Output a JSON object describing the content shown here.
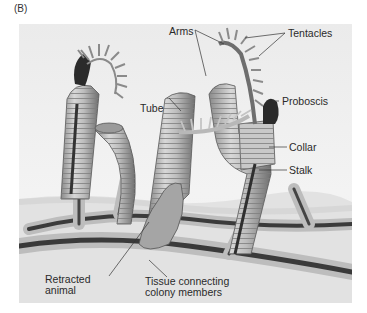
{
  "figure": {
    "panel_label": "(B)",
    "labels": {
      "arms": "Arms",
      "tentacles": "Tentacles",
      "proboscis": "Proboscis",
      "tube": "Tube",
      "collar": "Collar",
      "stalk": "Stalk",
      "retracted_line1": "Retracted",
      "retracted_line2": "animal",
      "tissue_line1": "Tissue connecting",
      "tissue_line2": "colony members"
    }
  }
}
